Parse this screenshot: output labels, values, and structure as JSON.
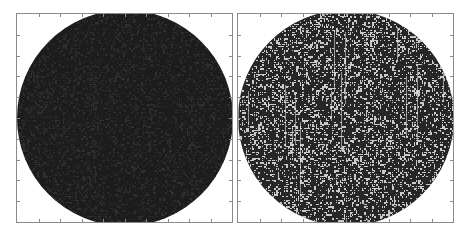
{
  "figure": {
    "panels": [
      {
        "name": "left-panel",
        "description": "dark filled disk with fine speckle texture",
        "frame": {
          "x": 16,
          "y": 13,
          "w": 217,
          "h": 210
        },
        "disk": {
          "cx": 108,
          "cy": 104,
          "r": 108
        },
        "base_color": "#1c1c1c",
        "speckle_light": "#2e2e2e",
        "speckle_density": 0.35
      },
      {
        "name": "right-panel",
        "description": "speckle-pattern disk with high-contrast black and white grains",
        "frame": {
          "x": 237,
          "y": 13,
          "w": 217,
          "h": 210
        },
        "disk": {
          "cx": 108,
          "cy": 104,
          "r": 108
        },
        "base_color": "#262626",
        "speckle_light": "#e8e8e8",
        "speckle_density": 0.38
      }
    ],
    "ticks": {
      "count_per_side": 10,
      "length": 3,
      "color": "#8a8a8a"
    },
    "colors": {
      "background": "#ffffff",
      "frame": "#8a8a8a"
    }
  }
}
